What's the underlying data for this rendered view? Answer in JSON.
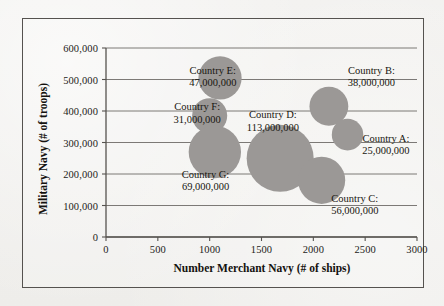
{
  "chart_data": {
    "type": "scatter",
    "subtype": "bubble",
    "title": "",
    "xlabel": "Number Merchant Navy (# of ships)",
    "ylabel": "Military Navy (# of troops)",
    "xlim": [
      0,
      3000
    ],
    "ylim": [
      0,
      600000
    ],
    "xticks": [
      "0",
      "500",
      "1000",
      "1500",
      "2000",
      "2500",
      "3000"
    ],
    "xtick_values": [
      0,
      500,
      1000,
      1500,
      2000,
      2500,
      3000
    ],
    "yticks": [
      "0",
      "100,000",
      "200,000",
      "300,000",
      "400,000",
      "500,000",
      "600,000"
    ],
    "ytick_values": [
      0,
      100000,
      200000,
      300000,
      400000,
      500000,
      600000
    ],
    "grid": "horizontal",
    "legend": "none",
    "bubble_color": "#9b9896",
    "points": [
      {
        "label": "Country E:",
        "value_text": "47,000,000",
        "size": 47000000,
        "x": 1100,
        "y": 505000,
        "label_x": 1030,
        "label_y": 527000
      },
      {
        "label": "Country B:",
        "value_text": "38,000,000",
        "size": 38000000,
        "x": 2150,
        "y": 415000,
        "label_x": 2560,
        "label_y": 527000
      },
      {
        "label": "Country F:",
        "value_text": "31,000,000",
        "size": 31000000,
        "x": 1000,
        "y": 385000,
        "label_x": 880,
        "label_y": 412000
      },
      {
        "label": "Country D:",
        "value_text": "113,000,000",
        "size": 113000000,
        "x": 1680,
        "y": 250000,
        "label_x": 1610,
        "label_y": 387000
      },
      {
        "label": "Country A:",
        "value_text": "25,000,000",
        "size": 25000000,
        "x": 2330,
        "y": 325000,
        "label_x": 2700,
        "label_y": 312000
      },
      {
        "label": "Country G:",
        "value_text": "69,000,000",
        "size": 69000000,
        "x": 1050,
        "y": 270000,
        "label_x": 960,
        "label_y": 197000
      },
      {
        "label": "Country C:",
        "value_text": "56,000,000",
        "size": 56000000,
        "x": 2080,
        "y": 180000,
        "label_x": 2400,
        "label_y": 122000
      }
    ]
  }
}
